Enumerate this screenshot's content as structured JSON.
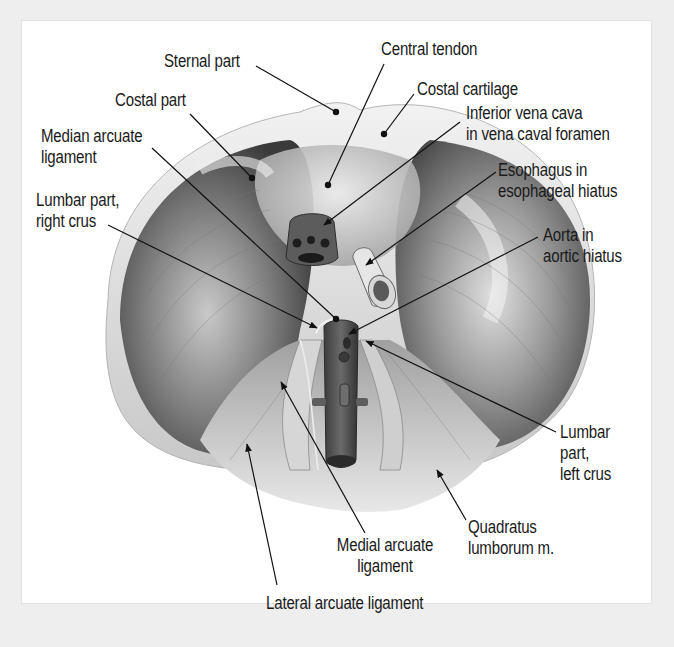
{
  "figure": {
    "background_color": "#eeeeee",
    "panel_color": "#ffffff",
    "ink_color": "#1a1a1a"
  },
  "labels": [
    {
      "id": "sternal-part",
      "text": "Sternal part",
      "x": 164,
      "y": 51,
      "align": "left",
      "leader": {
        "from": [
          256,
          66
        ],
        "to": [
          336,
          112
        ],
        "end": "dot"
      }
    },
    {
      "id": "central-tendon",
      "text": "Central tendon",
      "x": 381,
      "y": 39,
      "align": "left",
      "leader": {
        "from": [
          384,
          64
        ],
        "to": [
          328,
          185
        ],
        "end": "dot"
      }
    },
    {
      "id": "costal-part",
      "text": "Costal part",
      "x": 115,
      "y": 90,
      "align": "left",
      "leader": {
        "from": [
          190,
          114
        ],
        "to": [
          252,
          178
        ],
        "end": "dot"
      }
    },
    {
      "id": "costal-cartilage",
      "text": "Costal cartilage",
      "x": 417,
      "y": 79,
      "align": "left",
      "leader": {
        "from": [
          414,
          94
        ],
        "to": [
          384,
          134
        ],
        "end": "dot"
      }
    },
    {
      "id": "inferior-vena-cava",
      "text": "Inferior vena cava\nin vena caval foramen",
      "x": 466,
      "y": 103,
      "align": "left",
      "leader": {
        "from": [
          460,
          122
        ],
        "to": [
          324,
          225
        ],
        "end": "arrow"
      }
    },
    {
      "id": "median-arcuate-ligament",
      "text": "Median arcuate\nligament",
      "x": 41,
      "y": 126,
      "align": "left",
      "leader": {
        "from": [
          152,
          148
        ],
        "to": [
          336,
          319
        ],
        "end": "dot"
      }
    },
    {
      "id": "esophagus",
      "text": "Esophagus in\nesophageal hiatus",
      "x": 498,
      "y": 160,
      "align": "left",
      "leader": {
        "from": [
          496,
          172
        ],
        "to": [
          366,
          265
        ],
        "end": "arrow"
      }
    },
    {
      "id": "lumbar-part-right-crus",
      "text": "Lumbar part,\nright crus",
      "x": 36,
      "y": 190,
      "align": "left",
      "leader": {
        "from": [
          108,
          225
        ],
        "to": [
          317,
          328
        ],
        "end": "arrow"
      }
    },
    {
      "id": "aorta",
      "text": "Aorta in\naortic hiatus",
      "x": 543,
      "y": 225,
      "align": "left",
      "leader": {
        "from": [
          538,
          237
        ],
        "to": [
          349,
          334
        ],
        "end": "arrow"
      }
    },
    {
      "id": "lumbar-part-left-crus",
      "text": "Lumbar\npart,\nleft crus",
      "x": 560,
      "y": 422,
      "align": "left",
      "leader": {
        "from": [
          556,
          432
        ],
        "to": [
          366,
          341
        ],
        "end": "arrow"
      }
    },
    {
      "id": "quadratus-lumborum",
      "text": "Quadratus\nlumborum m.",
      "x": 468,
      "y": 517,
      "align": "left",
      "leader": {
        "from": [
          466,
          520
        ],
        "to": [
          437,
          470
        ],
        "end": "arrow"
      }
    },
    {
      "id": "medial-arcuate-ligament",
      "text": "Medial arcuate\nligament",
      "x": 325,
      "y": 535,
      "align": "center",
      "leader": {
        "from": [
          365,
          533
        ],
        "to": [
          281,
          382
        ],
        "end": "arrow"
      }
    },
    {
      "id": "lateral-arcuate-ligament",
      "text": "Lateral arcuate ligament",
      "x": 266,
      "y": 593,
      "align": "left",
      "leader": {
        "from": [
          277,
          585
        ],
        "to": [
          247,
          444
        ],
        "end": "arrow"
      }
    }
  ]
}
